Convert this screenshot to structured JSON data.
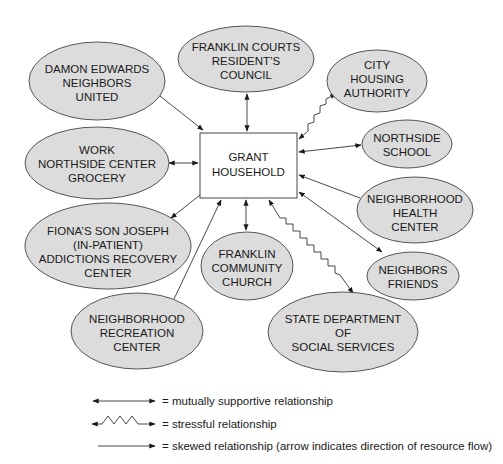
{
  "diagram": {
    "center": {
      "id": "grant",
      "lines": [
        "GRANT",
        "HOUSEHOLD"
      ]
    },
    "nodes": [
      {
        "id": "damon",
        "lines": [
          "DAMON EDWARDS",
          "NEIGHBORS",
          "UNITED"
        ]
      },
      {
        "id": "courts",
        "lines": [
          "FRANKLIN COURTS",
          "RESIDENT’S",
          "COUNCIL"
        ]
      },
      {
        "id": "housing",
        "lines": [
          "CITY",
          "HOUSING",
          "AUTHORITY"
        ]
      },
      {
        "id": "work",
        "lines": [
          "WORK",
          "NORTHSIDE CENTER",
          "GROCERY"
        ]
      },
      {
        "id": "school",
        "lines": [
          "NORTHSIDE",
          "SCHOOL"
        ]
      },
      {
        "id": "health",
        "lines": [
          "NEIGHBORHOOD",
          "HEALTH",
          "CENTER"
        ]
      },
      {
        "id": "fiona",
        "lines": [
          "FIONA’S SON JOSEPH",
          "(IN-PATIENT)",
          "ADDICTIONS RECOVERY",
          "CENTER"
        ]
      },
      {
        "id": "church",
        "lines": [
          "FRANKLIN",
          "COMMUNITY",
          "CHURCH"
        ]
      },
      {
        "id": "friends",
        "lines": [
          "NEIGHBORS",
          "FRIENDS"
        ]
      },
      {
        "id": "recreation",
        "lines": [
          "NEIGHBORHOOD",
          "RECREATION",
          "CENTER"
        ]
      },
      {
        "id": "state",
        "lines": [
          "STATE DEPARTMENT",
          "OF",
          "SOCIAL SERVICES"
        ]
      }
    ],
    "relationships": [
      {
        "from": "damon",
        "to": "grant",
        "type": "skewed"
      },
      {
        "from": "courts",
        "to": "grant",
        "type": "mutual"
      },
      {
        "from": "housing",
        "to": "grant",
        "type": "stressful"
      },
      {
        "from": "work",
        "to": "grant",
        "type": "mutual"
      },
      {
        "from": "school",
        "to": "grant",
        "type": "mutual"
      },
      {
        "from": "health",
        "to": "grant",
        "type": "skewed"
      },
      {
        "from": "grant",
        "to": "fiona",
        "type": "skewed"
      },
      {
        "from": "church",
        "to": "grant",
        "type": "mutual"
      },
      {
        "from": "friends",
        "to": "grant",
        "type": "mutual"
      },
      {
        "from": "recreation",
        "to": "grant",
        "type": "skewed"
      },
      {
        "from": "state",
        "to": "grant",
        "type": "stressful"
      }
    ],
    "legend": [
      {
        "type": "mutual",
        "label": "= mutually supportive relationship"
      },
      {
        "type": "stressful",
        "label": "= stressful relationship"
      },
      {
        "type": "skewed",
        "label": "= skewed relationship (arrow indicates direction of resource flow)"
      }
    ],
    "colors": {
      "node_fill": "#dcdcdc",
      "stroke": "#333333",
      "text": "#1a1a1a",
      "box_fill": "#ffffff"
    }
  }
}
